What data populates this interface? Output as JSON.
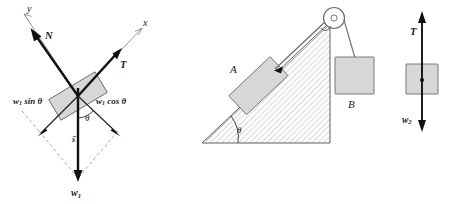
{
  "figure": {
    "panel_count": 3,
    "background_color": "#ffffff",
    "ink_color": "#111111",
    "block_fill_color": "#d7d7d7",
    "block_stroke_color": "#6e6e6e",
    "axis_color": "#8e8e8e",
    "dashed_color": "#9a9a9a"
  },
  "panel_left": {
    "name": "free-body-diagram-block-on-incline",
    "axis_x_label": "x",
    "axis_y_label": "y",
    "vectors": [
      {
        "id": "normal",
        "label": "N",
        "label_sub": "",
        "direction": "up-left",
        "style": "thick"
      },
      {
        "id": "tension",
        "label": "T",
        "label_sub": "",
        "direction": "up-right",
        "style": "thick"
      },
      {
        "id": "weight",
        "label": "w",
        "label_sub": "1",
        "direction": "down",
        "style": "thick"
      },
      {
        "id": "weight-par",
        "label": "w",
        "label_sub": "1",
        "direction": "down-left",
        "style": "thin"
      },
      {
        "id": "weight-perp",
        "label": "w",
        "label_sub": "1",
        "direction": "down-right",
        "style": "thin"
      }
    ],
    "component_label_parallel": "sin",
    "component_label_perpendicular": "cos",
    "weight_symbol": "w",
    "weight_subscript": "1",
    "angle_label": "θ",
    "shaft_label": "w",
    "shaft_label_sub": "1"
  },
  "panel_middle": {
    "name": "inclined-plane-with-pulley",
    "block_on_incline_label": "A",
    "hanging_block_label": "B",
    "angle_label": "θ",
    "has_pulley": true,
    "has_cord": true,
    "incline_hatched": true
  },
  "panel_right": {
    "name": "free-body-diagram-hanging-block",
    "tension_label": "T",
    "weight_label": "w",
    "weight_subscript": "2",
    "tension_direction": "up",
    "weight_direction": "down"
  }
}
